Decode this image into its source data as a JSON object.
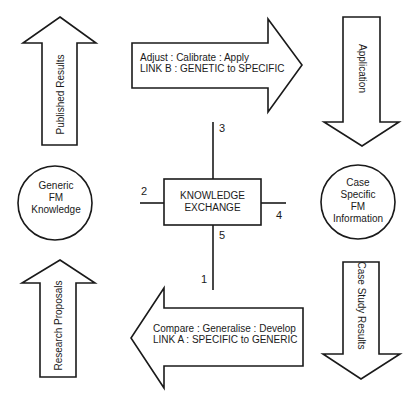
{
  "diagram": {
    "arrows": {
      "published_results": {
        "label": "Published Results",
        "direction": "up"
      },
      "link_b": {
        "line1": "Adjust : Calibrate : Apply",
        "line2": "LINK B : GENETIC to SPECIFIC",
        "direction": "right"
      },
      "application": {
        "label": "Application",
        "direction": "down"
      },
      "research_proposals": {
        "label": "Research Proposals",
        "direction": "up"
      },
      "link_a": {
        "line1": "Compare : Generalise : Develop",
        "line2": "LINK A : SPECIFIC to GENERIC",
        "direction": "left"
      },
      "case_study_results": {
        "label": "Case Study Results",
        "direction": "down"
      }
    },
    "nodes": {
      "generic": {
        "line1": "Generic",
        "line2": "FM",
        "line3": "Knowledge"
      },
      "case": {
        "line1": "Case",
        "line2": "Specific",
        "line3": "FM",
        "line4": "Information"
      },
      "exchange": {
        "line1": "KNOWLEDGE",
        "line2": "EXCHANGE"
      }
    },
    "connectors": {
      "n1": "1",
      "n2": "2",
      "n3": "3",
      "n4": "4",
      "n5": "5"
    },
    "colors": {
      "stroke": "#1a1a1a",
      "fill": "#ffffff"
    }
  }
}
